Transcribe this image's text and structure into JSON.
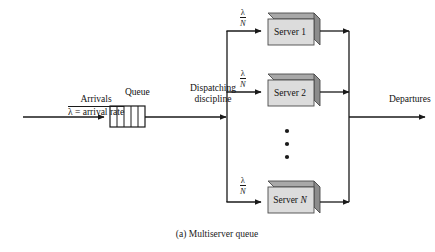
{
  "figure": {
    "caption": "(a) Multiserver queue",
    "background_color": "#ffffff",
    "line_color": "#1a1a1a",
    "box_fill_color": "#dcdcdc",
    "box_side_color": "#8c8c8c",
    "box_top_color": "#a8a8a8"
  },
  "arrivals": {
    "top_label": "Arrivals",
    "bottom_label": "λ = arrival rate"
  },
  "queue": {
    "label": "Queue",
    "cells": 5
  },
  "dispatching": {
    "line1": "Dispatching",
    "line2": "discipline"
  },
  "branches": [
    {
      "fraction_numerator": "λ",
      "fraction_denominator": "N"
    },
    {
      "fraction_numerator": "λ",
      "fraction_denominator": "N"
    },
    {
      "fraction_numerator": "λ",
      "fraction_denominator": "N"
    }
  ],
  "servers": [
    {
      "name": "Server",
      "index": "1",
      "index_italic": false
    },
    {
      "name": "Server",
      "index": "2",
      "index_italic": false
    },
    {
      "name": "Server",
      "index": "N",
      "index_italic": true
    }
  ],
  "ellipsis": {
    "dots": 3
  },
  "departures": {
    "label": "Departures"
  }
}
